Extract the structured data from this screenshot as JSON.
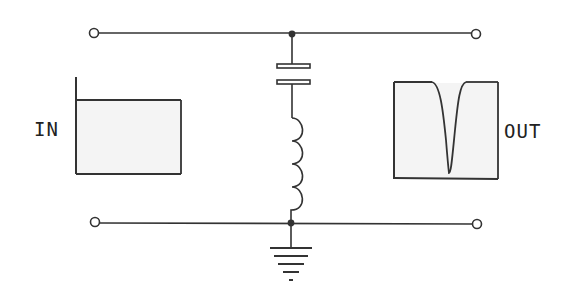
{
  "diagram": {
    "type": "circuit-schematic",
    "labels": {
      "input": "IN",
      "output": "OUT"
    },
    "components": [
      {
        "id": "C1",
        "kind": "capacitor",
        "placement": "shunt, upper"
      },
      {
        "id": "L1",
        "kind": "inductor",
        "placement": "shunt, lower, in series with C1",
        "turns": 4
      },
      {
        "id": "GND",
        "kind": "ground",
        "placement": "bottom rail"
      }
    ],
    "terminals": [
      {
        "id": "in-top"
      },
      {
        "id": "in-bottom"
      },
      {
        "id": "out-top"
      },
      {
        "id": "out-bottom"
      }
    ],
    "waveforms": {
      "input": "flat (broadband) spectrum",
      "output": "spectrum with a sharp notch at resonant frequency"
    },
    "colors": {
      "line": "#333333",
      "box_fill": "#f4f4f4"
    }
  }
}
